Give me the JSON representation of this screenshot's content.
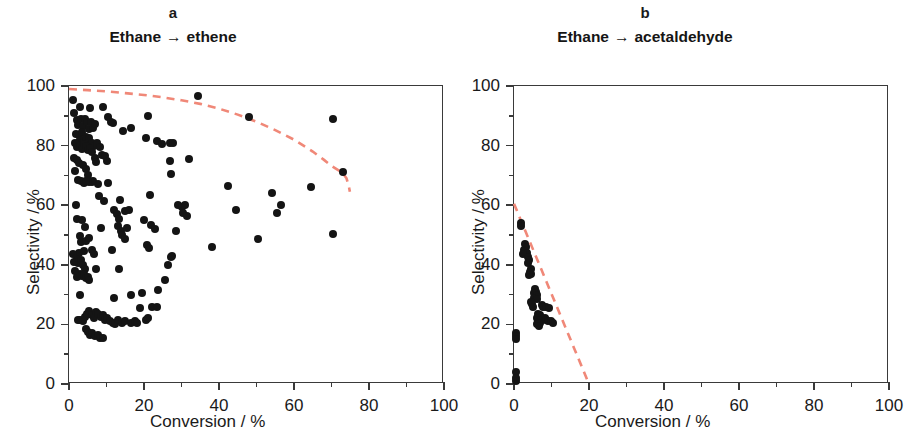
{
  "figure": {
    "panels": [
      {
        "letter": "a",
        "title_reactant": "Ethane",
        "title_arrow": "→",
        "title_product": "ethene",
        "xlabel": "Conversion  / %",
        "ylabel": "Selectivity / %"
      },
      {
        "letter": "b",
        "title_reactant": "Ethane",
        "title_arrow": "→",
        "title_product": "acetaldehyde",
        "xlabel": "Conversion  / %",
        "ylabel": "Selectivity / %"
      }
    ],
    "axis_ticks": {
      "x": [
        "0",
        "20",
        "40",
        "60",
        "80",
        "100"
      ],
      "y": [
        "0",
        "20",
        "40",
        "60",
        "80",
        "100"
      ]
    },
    "colors": {
      "marker": "#141414",
      "trendline": "#f08878",
      "axis": "#3a3a3a",
      "text": "#1a1a1a",
      "background": "#ffffff"
    }
  },
  "chart_data": [
    {
      "type": "scatter",
      "panel": "a",
      "title": "Ethane → ethene",
      "xlabel": "Conversion / %",
      "ylabel": "Selectivity / %",
      "xlim": [
        0,
        100
      ],
      "ylim": [
        0,
        100
      ],
      "xticks": [
        0,
        20,
        40,
        60,
        80,
        100
      ],
      "yticks": [
        0,
        20,
        40,
        60,
        80,
        100
      ],
      "minor_tick_interval": 10,
      "grid": false,
      "legend": null,
      "marker_color": "#141414",
      "points": [
        [
          1.0,
          95.2
        ],
        [
          1.2,
          91.0
        ],
        [
          2.8,
          93.0
        ],
        [
          5.5,
          92.5
        ],
        [
          9.0,
          92.8
        ],
        [
          10.5,
          89.5
        ],
        [
          11.2,
          88.0
        ],
        [
          11.8,
          87.5
        ],
        [
          2.0,
          88.5
        ],
        [
          2.4,
          87.0
        ],
        [
          3.2,
          88.8
        ],
        [
          3.6,
          86.5
        ],
        [
          4.2,
          89.0
        ],
        [
          4.8,
          87.8
        ],
        [
          5.2,
          85.5
        ],
        [
          5.8,
          88.0
        ],
        [
          6.4,
          86.0
        ],
        [
          7.0,
          87.2
        ],
        [
          1.8,
          84.0
        ],
        [
          2.6,
          83.5
        ],
        [
          3.0,
          82.0
        ],
        [
          3.4,
          84.5
        ],
        [
          3.9,
          81.5
        ],
        [
          4.4,
          83.0
        ],
        [
          4.9,
          80.5
        ],
        [
          5.4,
          82.5
        ],
        [
          6.0,
          81.0
        ],
        [
          6.6,
          80.0
        ],
        [
          1.5,
          80.8
        ],
        [
          2.2,
          79.5
        ],
        [
          2.9,
          80.2
        ],
        [
          3.5,
          79.0
        ],
        [
          4.0,
          80.6
        ],
        [
          4.6,
          79.8
        ],
        [
          5.1,
          78.5
        ],
        [
          5.6,
          79.2
        ],
        [
          6.2,
          78.0
        ],
        [
          7.5,
          81.0
        ],
        [
          8.2,
          79.5
        ],
        [
          8.8,
          77.0
        ],
        [
          9.5,
          76.5
        ],
        [
          10.0,
          75.0
        ],
        [
          1.3,
          76.0
        ],
        [
          2.1,
          75.2
        ],
        [
          2.7,
          74.0
        ],
        [
          1.6,
          71.5
        ],
        [
          3.8,
          73.5
        ],
        [
          4.5,
          72.0
        ],
        [
          5.0,
          70.0
        ],
        [
          6.8,
          76.0
        ],
        [
          7.2,
          74.5
        ],
        [
          2.3,
          68.5
        ],
        [
          3.3,
          68.0
        ],
        [
          4.1,
          67.5
        ],
        [
          5.3,
          67.8
        ],
        [
          7.8,
          67.0
        ],
        [
          6.5,
          68.2
        ],
        [
          14.5,
          85.0
        ],
        [
          16.5,
          86.0
        ],
        [
          21.0,
          90.0
        ],
        [
          20.5,
          82.5
        ],
        [
          23.5,
          81.5
        ],
        [
          24.8,
          80.5
        ],
        [
          27.0,
          80.8
        ],
        [
          27.8,
          80.8
        ],
        [
          27.0,
          75.0
        ],
        [
          32.0,
          75.5
        ],
        [
          27.2,
          70.5
        ],
        [
          34.5,
          96.8
        ],
        [
          42.5,
          66.5
        ],
        [
          48.0,
          89.5
        ],
        [
          70.5,
          89.0
        ],
        [
          64.5,
          66.0
        ],
        [
          73.0,
          71.0
        ],
        [
          70.5,
          50.5
        ],
        [
          1.8,
          60.0
        ],
        [
          2.0,
          55.5
        ],
        [
          3.5,
          55.2
        ],
        [
          4.2,
          52.8
        ],
        [
          3.0,
          49.5
        ],
        [
          3.3,
          47.5
        ],
        [
          4.6,
          48.0
        ],
        [
          5.2,
          49.0
        ],
        [
          4.0,
          44.5
        ],
        [
          2.6,
          44.0
        ],
        [
          2.0,
          42.0
        ],
        [
          2.4,
          40.5
        ],
        [
          3.1,
          41.5
        ],
        [
          3.7,
          39.8
        ],
        [
          4.3,
          38.5
        ],
        [
          2.8,
          37.0
        ],
        [
          3.4,
          36.2
        ],
        [
          4.0,
          36.8
        ],
        [
          4.6,
          35.5
        ],
        [
          5.0,
          36.0
        ],
        [
          5.4,
          35.0
        ],
        [
          2.2,
          35.8
        ],
        [
          1.7,
          38.0
        ],
        [
          1.4,
          40.8
        ],
        [
          1.1,
          43.5
        ],
        [
          2.9,
          30.0
        ],
        [
          6.0,
          45.0
        ],
        [
          6.6,
          43.5
        ],
        [
          7.2,
          38.5
        ],
        [
          8.5,
          52.5
        ],
        [
          9.2,
          61.5
        ],
        [
          8.0,
          63.0
        ],
        [
          10.5,
          67.5
        ],
        [
          6.2,
          67.8
        ],
        [
          5.0,
          68.5
        ],
        [
          4.4,
          68.0
        ],
        [
          12.0,
          58.5
        ],
        [
          12.8,
          57.0
        ],
        [
          13.4,
          55.5
        ],
        [
          13.0,
          53.0
        ],
        [
          13.8,
          51.5
        ],
        [
          14.2,
          50.0
        ],
        [
          14.8,
          48.5
        ],
        [
          15.5,
          52.5
        ],
        [
          15.0,
          58.0
        ],
        [
          16.0,
          58.5
        ],
        [
          13.6,
          61.8
        ],
        [
          11.5,
          44.8
        ],
        [
          13.2,
          38.5
        ],
        [
          12.0,
          29.0
        ],
        [
          16.5,
          30.0
        ],
        [
          19.5,
          30.5
        ],
        [
          21.5,
          63.5
        ],
        [
          20.0,
          55.0
        ],
        [
          21.8,
          53.5
        ],
        [
          23.0,
          52.0
        ],
        [
          20.8,
          46.5
        ],
        [
          21.2,
          45.5
        ],
        [
          23.8,
          31.5
        ],
        [
          22.0,
          26.0
        ],
        [
          25.5,
          35.0
        ],
        [
          26.5,
          40.0
        ],
        [
          27.5,
          43.0
        ],
        [
          27.2,
          42.5
        ],
        [
          28.5,
          51.5
        ],
        [
          29.0,
          60.0
        ],
        [
          30.0,
          59.5
        ],
        [
          30.5,
          57.5
        ],
        [
          31.0,
          60.0
        ],
        [
          31.5,
          56.5
        ],
        [
          38.0,
          46.0
        ],
        [
          44.5,
          58.5
        ],
        [
          50.5,
          48.5
        ],
        [
          54.0,
          64.0
        ],
        [
          55.5,
          57.5
        ],
        [
          56.5,
          60.0
        ],
        [
          3.0,
          21.5
        ],
        [
          3.6,
          21.0
        ],
        [
          4.2,
          22.5
        ],
        [
          4.8,
          23.5
        ],
        [
          5.4,
          24.5
        ],
        [
          6.0,
          23.0
        ],
        [
          6.6,
          22.0
        ],
        [
          7.2,
          24.0
        ],
        [
          7.8,
          23.5
        ],
        [
          8.4,
          22.5
        ],
        [
          9.0,
          23.0
        ],
        [
          9.6,
          21.5
        ],
        [
          10.2,
          22.0
        ],
        [
          11.0,
          21.0
        ],
        [
          11.6,
          20.5
        ],
        [
          12.2,
          20.0
        ],
        [
          13.0,
          21.5
        ],
        [
          14.0,
          20.5
        ],
        [
          15.0,
          21.0
        ],
        [
          16.5,
          20.5
        ],
        [
          17.5,
          21.0
        ],
        [
          18.2,
          20.5
        ],
        [
          20.5,
          21.5
        ],
        [
          21.0,
          22.0
        ],
        [
          4.5,
          18.5
        ],
        [
          5.0,
          17.5
        ],
        [
          5.6,
          16.5
        ],
        [
          6.2,
          17.0
        ],
        [
          7.0,
          16.0
        ],
        [
          7.6,
          16.5
        ],
        [
          8.2,
          15.5
        ],
        [
          9.0,
          15.5
        ],
        [
          2.5,
          21.5
        ],
        [
          19.0,
          25.5
        ],
        [
          23.5,
          26.0
        ]
      ],
      "trendline": {
        "style": "dashed",
        "color": "#f08878",
        "description": "Upper-bound equilibrium-like curve, starts near 99% selectivity at 0% conversion, decreases gradually, then drops steeply near 75% conversion",
        "points": [
          [
            0,
            99.0
          ],
          [
            5,
            98.6
          ],
          [
            10,
            98.2
          ],
          [
            15,
            97.6
          ],
          [
            20,
            97.0
          ],
          [
            25,
            96.2
          ],
          [
            30,
            95.2
          ],
          [
            35,
            94.0
          ],
          [
            40,
            92.4
          ],
          [
            45,
            90.4
          ],
          [
            50,
            88.0
          ],
          [
            55,
            85.2
          ],
          [
            60,
            82.0
          ],
          [
            65,
            78.0
          ],
          [
            68,
            75.2
          ],
          [
            70,
            73.2
          ],
          [
            72,
            71.6
          ],
          [
            73,
            70.8
          ],
          [
            74,
            69.0
          ],
          [
            74.6,
            66.5
          ],
          [
            74.9,
            64.5
          ]
        ]
      }
    },
    {
      "type": "scatter",
      "panel": "b",
      "title": "Ethane → acetaldehyde",
      "xlabel": "Conversion / %",
      "ylabel": "Selectivity / %",
      "xlim": [
        0,
        100
      ],
      "ylim": [
        0,
        100
      ],
      "xticks": [
        0,
        20,
        40,
        60,
        80,
        100
      ],
      "yticks": [
        0,
        20,
        40,
        60,
        80,
        100
      ],
      "minor_tick_interval": 10,
      "grid": false,
      "legend": null,
      "marker_color": "#141414",
      "points": [
        [
          1.8,
          54.0
        ],
        [
          1.9,
          53.0
        ],
        [
          3.0,
          47.0
        ],
        [
          3.2,
          46.0
        ],
        [
          2.6,
          45.0
        ],
        [
          2.8,
          44.5
        ],
        [
          3.4,
          44.0
        ],
        [
          2.4,
          43.5
        ],
        [
          3.8,
          42.5
        ],
        [
          4.0,
          41.5
        ],
        [
          3.6,
          40.5
        ],
        [
          4.4,
          38.5
        ],
        [
          4.2,
          37.5
        ],
        [
          4.6,
          37.0
        ],
        [
          3.9,
          36.5
        ],
        [
          5.6,
          32.0
        ],
        [
          5.8,
          31.0
        ],
        [
          5.4,
          30.5
        ],
        [
          6.0,
          30.0
        ],
        [
          5.2,
          29.0
        ],
        [
          6.2,
          28.5
        ],
        [
          4.6,
          27.5
        ],
        [
          4.8,
          26.8
        ],
        [
          5.0,
          26.0
        ],
        [
          7.4,
          26.5
        ],
        [
          7.8,
          26.0
        ],
        [
          8.6,
          26.0
        ],
        [
          9.4,
          25.5
        ],
        [
          6.4,
          23.5
        ],
        [
          6.8,
          23.0
        ],
        [
          6.0,
          22.0
        ],
        [
          6.4,
          21.5
        ],
        [
          6.8,
          21.0
        ],
        [
          7.2,
          21.5
        ],
        [
          7.0,
          20.5
        ],
        [
          6.2,
          20.0
        ],
        [
          6.6,
          19.5
        ],
        [
          8.2,
          22.0
        ],
        [
          8.6,
          21.5
        ],
        [
          9.0,
          21.0
        ],
        [
          9.8,
          21.0
        ],
        [
          10.4,
          20.5
        ],
        [
          0.4,
          17.0
        ],
        [
          0.5,
          16.0
        ],
        [
          0.4,
          15.0
        ],
        [
          0.4,
          4.0
        ],
        [
          0.5,
          2.0
        ],
        [
          0.4,
          1.0
        ]
      ],
      "trendline": {
        "style": "dashed",
        "color": "#f08878",
        "description": "Straight declining boundary line from ~60.5% selectivity at 0% conversion down to 0% selectivity at ~20% conversion",
        "points": [
          [
            0,
            60.5
          ],
          [
            20,
            0
          ]
        ]
      }
    }
  ]
}
